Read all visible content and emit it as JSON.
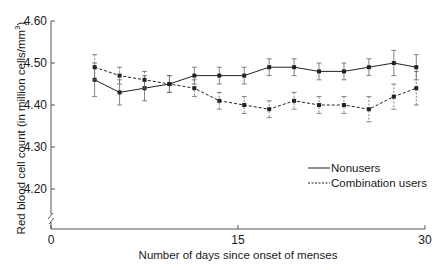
{
  "chart_data": {
    "type": "line",
    "title": "",
    "xlabel": "Number of days since onset of menses",
    "ylabel": "Red blood cell count (in million cells/mm³)",
    "xlim": [
      0,
      30
    ],
    "ylim": [
      4.1,
      4.6
    ],
    "y_axis_break": true,
    "x_ticks": [
      0,
      15,
      30
    ],
    "x_tick_labels": [
      "0",
      "15",
      "30"
    ],
    "y_ticks": [
      4.2,
      4.3,
      4.4,
      4.5,
      4.6
    ],
    "y_tick_labels": [
      "4.20",
      "4.30",
      "4.40",
      "4.50",
      "4.60"
    ],
    "grid": false,
    "legend_position": "right-center",
    "x": [
      3.5,
      5.5,
      7.5,
      9.5,
      11.5,
      13.5,
      15.5,
      17.5,
      19.5,
      21.5,
      23.5,
      25.5,
      27.5,
      29.3
    ],
    "series": [
      {
        "name": "Nonusers",
        "line_style": "solid",
        "values": [
          4.46,
          4.43,
          4.44,
          4.45,
          4.47,
          4.47,
          4.47,
          4.49,
          4.49,
          4.48,
          4.48,
          4.49,
          4.5,
          4.49
        ],
        "errors": [
          0.04,
          0.03,
          0.03,
          0.02,
          0.02,
          0.02,
          0.02,
          0.02,
          0.02,
          0.02,
          0.02,
          0.02,
          0.03,
          0.03
        ]
      },
      {
        "name": "Combination users",
        "line_style": "dashed",
        "values": [
          4.49,
          4.47,
          4.46,
          4.45,
          4.44,
          4.41,
          4.4,
          4.39,
          4.41,
          4.4,
          4.4,
          4.39,
          4.42,
          4.44
        ],
        "errors": [
          0.03,
          0.02,
          0.02,
          0.02,
          0.02,
          0.02,
          0.02,
          0.02,
          0.02,
          0.02,
          0.02,
          0.03,
          0.03,
          0.04
        ]
      }
    ]
  },
  "axes": {
    "x_title": "Number of days since onset of menses",
    "y_title": "Red blood cell count (in million cells/mm",
    "y_title_sup": "3",
    "y_title_end": ")"
  },
  "legend": {
    "items": [
      {
        "label": "Nonusers",
        "style": "solid"
      },
      {
        "label": "Combination users",
        "style": "dashed"
      }
    ]
  },
  "colors": {
    "line": "#222222",
    "axis": "#555555",
    "error_bar": "#666666"
  }
}
